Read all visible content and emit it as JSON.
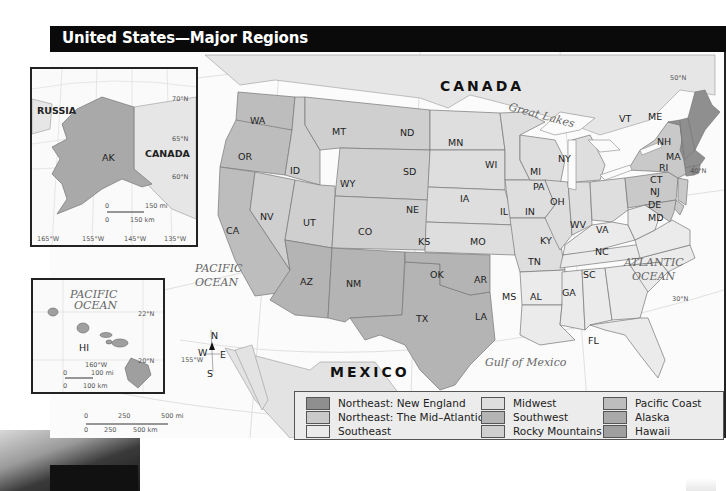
{
  "title": "United States—Major Regions",
  "colors": {
    "new_england": "#8f8f8f",
    "mid_atlantic": "#c9c9c9",
    "southeast": "#ebebeb",
    "midwest": "#dedede",
    "southwest": "#b4b4b4",
    "rocky_mountains": "#cfcfcf",
    "pacific_coast": "#bdbdbd",
    "alaska": "#a9a9a9",
    "hawaii": "#9f9f9f",
    "canada_land": "#e6e6e6",
    "mexico_land": "#e3e3e3",
    "water": "#fbfbfb"
  },
  "labels": {
    "canada": "CANADA",
    "mexico": "MEXICO",
    "great_lakes": "Great Lakes",
    "pacific_ocean_1": "PACIFIC",
    "pacific_ocean_2": "OCEAN",
    "atlantic_ocean_1": "ATLANTIC",
    "atlantic_ocean_2": "OCEAN",
    "gulf": "Gulf of Mexico",
    "lat_50": "50°N",
    "lat_40": "40°N",
    "lat_30": "30°N",
    "lon_155": "155°W"
  },
  "states": [
    {
      "abbr": "WA"
    },
    {
      "abbr": "OR"
    },
    {
      "abbr": "CA"
    },
    {
      "abbr": "ID"
    },
    {
      "abbr": "NV"
    },
    {
      "abbr": "MT"
    },
    {
      "abbr": "WY"
    },
    {
      "abbr": "UT"
    },
    {
      "abbr": "CO"
    },
    {
      "abbr": "AZ"
    },
    {
      "abbr": "NM"
    },
    {
      "abbr": "TX"
    },
    {
      "abbr": "OK"
    },
    {
      "abbr": "ND"
    },
    {
      "abbr": "SD"
    },
    {
      "abbr": "NE"
    },
    {
      "abbr": "KS"
    },
    {
      "abbr": "MN"
    },
    {
      "abbr": "IA"
    },
    {
      "abbr": "MO"
    },
    {
      "abbr": "WI"
    },
    {
      "abbr": "IL"
    },
    {
      "abbr": "IN"
    },
    {
      "abbr": "MI"
    },
    {
      "abbr": "OH"
    },
    {
      "abbr": "KY"
    },
    {
      "abbr": "TN"
    },
    {
      "abbr": "AR"
    },
    {
      "abbr": "LA"
    },
    {
      "abbr": "MS"
    },
    {
      "abbr": "AL"
    },
    {
      "abbr": "GA"
    },
    {
      "abbr": "FL"
    },
    {
      "abbr": "SC"
    },
    {
      "abbr": "NC"
    },
    {
      "abbr": "VA"
    },
    {
      "abbr": "WV"
    },
    {
      "abbr": "PA"
    },
    {
      "abbr": "NY"
    },
    {
      "abbr": "VT"
    },
    {
      "abbr": "ME"
    },
    {
      "abbr": "NH"
    },
    {
      "abbr": "MA"
    },
    {
      "abbr": "RI"
    },
    {
      "abbr": "CT"
    },
    {
      "abbr": "NJ"
    },
    {
      "abbr": "DE"
    },
    {
      "abbr": "MD"
    }
  ],
  "compass": {
    "n": "N",
    "s": "S",
    "e": "E",
    "w": "W"
  },
  "scale_main": {
    "mi_0": "0",
    "mi_250": "250",
    "mi_500": "500 mi",
    "km_0": "0",
    "km_250": "250",
    "km_500": "500 km"
  },
  "alaska_inset": {
    "russia": "RUSSIA",
    "canada": "CANADA",
    "ak": "AK",
    "lat_70": "70°N",
    "lat_65": "65°N",
    "lat_60": "60°N",
    "lon": [
      "165°W",
      "155°W",
      "145°W",
      "135°W"
    ],
    "scale_mi_0": "0",
    "scale_mi": "150 mi",
    "scale_km_0": "0",
    "scale_km": "150 km"
  },
  "hawaii_inset": {
    "ocean_1": "PACIFIC",
    "ocean_2": "OCEAN",
    "hi": "HI",
    "lat_22": "22°N",
    "lat_20": "20°N",
    "lon_160": "160°W",
    "scale_mi_0": "0",
    "scale_mi": "100 mi",
    "scale_km_0": "0",
    "scale_km": "100 km"
  },
  "legend": {
    "items": [
      {
        "label": "Northeast: New England",
        "color": "#8f8f8f"
      },
      {
        "label": "Northeast: The Mid–Atlantic",
        "color": "#c9c9c9"
      },
      {
        "label": "Southeast",
        "color": "#ebebeb"
      },
      {
        "label": "Midwest",
        "color": "#dedede"
      },
      {
        "label": "Southwest",
        "color": "#b4b4b4"
      },
      {
        "label": "Rocky Mountains",
        "color": "#cfcfcf"
      },
      {
        "label": "Pacific Coast",
        "color": "#bdbdbd"
      },
      {
        "label": "Alaska",
        "color": "#a9a9a9"
      },
      {
        "label": "Hawaii",
        "color": "#9f9f9f"
      }
    ]
  }
}
